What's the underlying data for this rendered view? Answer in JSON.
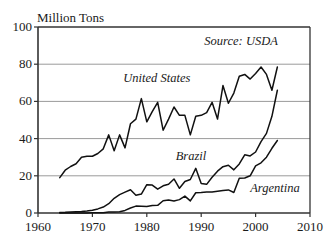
{
  "chart_data": {
    "type": "line",
    "title": "Million Tons",
    "xlabel": "",
    "ylabel": "Million Tons",
    "xlim": [
      1960,
      2010
    ],
    "ylim": [
      0,
      100
    ],
    "xticks": [
      "1960",
      "1970",
      "1980",
      "1990",
      "2000",
      "2010"
    ],
    "yticks": [
      "0",
      "20",
      "40",
      "60",
      "80",
      "100"
    ],
    "grid": true,
    "legend_position": "inline-annotations",
    "annotations": [
      {
        "text": "Source: USDA",
        "x": 2004,
        "y": 92
      },
      {
        "text": "United States",
        "x": 1988,
        "y": 72
      },
      {
        "text": "Brazil",
        "x": 1991,
        "y": 30
      },
      {
        "text": "Argentina",
        "x": 1999,
        "y": 13
      }
    ],
    "series": [
      {
        "name": "United States",
        "x": [
          1964,
          1965,
          1966,
          1967,
          1968,
          1969,
          1970,
          1971,
          1972,
          1973,
          1974,
          1975,
          1976,
          1977,
          1978,
          1979,
          1980,
          1981,
          1982,
          1983,
          1984,
          1985,
          1986,
          1987,
          1988,
          1989,
          1990,
          1991,
          1992,
          1993,
          1994,
          1995,
          1996,
          1997,
          1998,
          1999,
          2000,
          2001,
          2002,
          2003,
          2004
        ],
        "values": [
          19.0,
          23.0,
          25.0,
          26.5,
          30.0,
          30.5,
          30.5,
          32.0,
          34.5,
          42.0,
          33.5,
          42.0,
          35.0,
          48.0,
          50.5,
          61.5,
          49.0,
          54.5,
          59.5,
          44.5,
          50.5,
          57.0,
          52.5,
          52.5,
          42.0,
          52.0,
          52.5,
          54.0,
          59.5,
          50.5,
          68.5,
          59.0,
          64.5,
          73.5,
          74.5,
          72.0,
          75.0,
          78.5,
          74.5,
          66.0,
          78.5
        ]
      },
      {
        "name": "Brazil",
        "x": [
          1964,
          1965,
          1966,
          1967,
          1968,
          1969,
          1970,
          1971,
          1972,
          1973,
          1974,
          1975,
          1976,
          1977,
          1978,
          1979,
          1980,
          1981,
          1982,
          1983,
          1984,
          1985,
          1986,
          1987,
          1988,
          1989,
          1990,
          1991,
          1992,
          1993,
          1994,
          1995,
          1996,
          1997,
          1998,
          1999,
          2000,
          2001,
          2002,
          2003,
          2004
        ],
        "values": [
          0.3,
          0.4,
          0.6,
          0.7,
          0.8,
          1.1,
          1.5,
          2.2,
          3.2,
          5.0,
          7.9,
          9.9,
          11.2,
          12.5,
          9.5,
          10.2,
          15.2,
          15.0,
          12.8,
          14.6,
          15.5,
          18.3,
          13.3,
          16.9,
          18.0,
          24.0,
          15.8,
          15.4,
          19.2,
          22.5,
          24.9,
          25.7,
          23.2,
          26.4,
          31.3,
          30.7,
          32.8,
          38.4,
          42.8,
          52.0,
          66.0
        ]
      },
      {
        "name": "Argentina",
        "x": [
          1964,
          1965,
          1966,
          1967,
          1968,
          1969,
          1970,
          1971,
          1972,
          1973,
          1974,
          1975,
          1976,
          1977,
          1978,
          1979,
          1980,
          1981,
          1982,
          1983,
          1984,
          1985,
          1986,
          1987,
          1988,
          1989,
          1990,
          1991,
          1992,
          1993,
          1994,
          1995,
          1996,
          1997,
          1998,
          1999,
          2000,
          2001,
          2002,
          2003,
          2004
        ],
        "values": [
          0.0,
          0.0,
          0.0,
          0.0,
          0.0,
          0.0,
          0.1,
          0.1,
          0.2,
          0.5,
          0.5,
          0.7,
          1.4,
          2.7,
          3.7,
          3.6,
          3.5,
          4.0,
          4.1,
          6.6,
          7.0,
          6.5,
          7.2,
          9.1,
          6.5,
          10.9,
          11.0,
          11.3,
          11.3,
          11.7,
          12.1,
          12.4,
          11.0,
          18.7,
          18.8,
          20.0,
          25.3,
          27.0,
          30.0,
          34.8,
          39.0
        ]
      }
    ]
  },
  "plot": {
    "title": "Million Tons",
    "source_note": "Source: USDA",
    "labels": {
      "united_states": "United States",
      "brazil": "Brazil",
      "argentina": "Argentina"
    },
    "yticks": [
      "100",
      "80",
      "60",
      "40",
      "20",
      "0"
    ],
    "xticks": [
      "1960",
      "1970",
      "1980",
      "1990",
      "2000",
      "2010"
    ],
    "colors": {
      "line": "#111111",
      "grid": "#9a9a9a",
      "axis": "#333333",
      "background": "#ffffff"
    }
  }
}
